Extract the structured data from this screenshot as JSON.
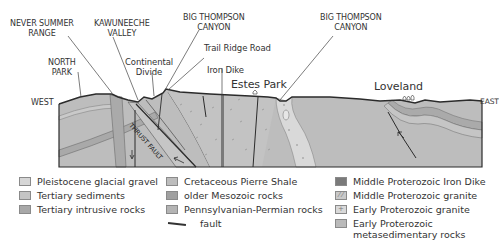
{
  "labels": {
    "never_summer_range": [
      "NEVER SUMMER",
      "RANGE"
    ],
    "kawuneeche_valley": [
      "KAWUNEECHE",
      "VALLEY"
    ],
    "big_thompson_canyon_west": [
      "BIG THOMPSON",
      "CANYON"
    ],
    "big_thompson_canyon_east": [
      "BIG THOMPSON",
      "CANYON"
    ],
    "north_park": [
      "NORTH",
      "PARK"
    ],
    "continental_divide": [
      "Continental",
      "Divide"
    ],
    "trail_ridge_road": "Trail Ridge Road",
    "iron_dike": "Iron Dike",
    "estes_park": "Estes Park",
    "loveland": "Loveland",
    "west": "WEST",
    "east": "EAST",
    "thrust_fault": "THRUST FAULT"
  },
  "legend": {
    "col1": [
      {
        "label": "Pleistocene glacial gravel",
        "color": "#d6d6d6",
        "mark": ""
      },
      {
        "label": "Tertiary sediments",
        "color": "#c4c4c4",
        "mark": ""
      },
      {
        "label": "Tertiary intrusive rocks",
        "color": "#a8a8a8",
        "mark": ""
      }
    ],
    "col2": [
      {
        "label": "Cretaceous Pierre Shale",
        "color": "#bdbdbd",
        "mark": ""
      },
      {
        "label": "older Mesozoic rocks",
        "color": "#a0a0a0",
        "mark": ""
      },
      {
        "label": "Pennsylvanian-Permian rocks",
        "color": "#b4b4b4",
        "mark": ""
      },
      {
        "label": "fault",
        "type": "line"
      }
    ],
    "col3": [
      {
        "label": "Middle Proterozoic Iron Dike",
        "color": "#7a7a7a",
        "mark": ""
      },
      {
        "label": "Middle Proterozoic granite",
        "color": "#c9c9c9",
        "mark": "⁄ ⁄"
      },
      {
        "label": "Early Proterozoic granite",
        "color": "#d9d9d9",
        "mark": "+"
      },
      {
        "label": "Early Proterozoic metasedimentary rocks",
        "lines": [
          "Early Proterozoic",
          "metasedimentary rocks"
        ],
        "color": "#bababa",
        "mark": ""
      }
    ]
  },
  "colors": {
    "outline": "#2b2b2b",
    "base_rock": "#bcbcbc",
    "light_band": "#cfcfcf",
    "mid_band": "#a9a9a9",
    "dike": "#7d7d7d",
    "granite_light": "#d4d4d4"
  }
}
